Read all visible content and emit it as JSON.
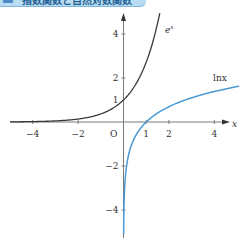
{
  "header": {
    "title": "指数関数と自然対数関数"
  },
  "colors": {
    "exp_curve": "#3a3a3a",
    "ln_curve": "#4a9ad6",
    "axis": "#7a7a7a",
    "banner": "#b9dcf2"
  },
  "chart_data": {
    "type": "line",
    "title": "指数関数と自然対数関数",
    "xlabel": "x",
    "ylabel": "",
    "xlim": [
      -5,
      5
    ],
    "ylim": [
      -5,
      5
    ],
    "grid": false,
    "origin_label": "O",
    "x_ticks": [
      -4,
      -2,
      1,
      2,
      4
    ],
    "x_tick_labels": [
      "−4",
      "−2",
      "1",
      "2",
      "4"
    ],
    "y_ticks": [
      4,
      2,
      1,
      -2,
      -4
    ],
    "y_tick_labels": [
      "4",
      "2",
      "1",
      "−2",
      "−4"
    ],
    "series": [
      {
        "name": "e^x",
        "label": "e",
        "label_sup": "x",
        "x": [
          -5,
          -4,
          -3,
          -2,
          -1,
          0,
          0.5,
          1,
          1.5,
          1.63
        ],
        "y": [
          0.007,
          0.018,
          0.05,
          0.135,
          0.368,
          1,
          1.649,
          2.718,
          4.482,
          5.1
        ]
      },
      {
        "name": "ln x",
        "label": "lnx",
        "x": [
          0.006,
          0.02,
          0.05,
          0.135,
          0.368,
          1,
          2,
          3,
          4,
          5.1
        ],
        "y": [
          -5.1,
          -3.91,
          -3.0,
          -2.0,
          -1.0,
          0,
          0.693,
          1.099,
          1.386,
          1.63
        ]
      }
    ]
  }
}
